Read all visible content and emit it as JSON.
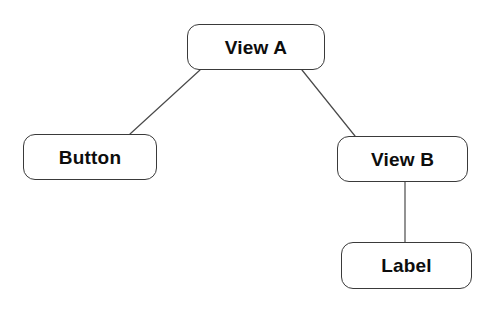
{
  "diagram": {
    "background_color": "#ffffff",
    "node_fill_color": "#ffffff",
    "node_border_color": "#3a3a3a",
    "node_text_color": "#0d0d0d",
    "edge_color": "#4a4a4a",
    "nodes": [
      {
        "id": "view-a",
        "label": "View A",
        "x": 187,
        "y": 24,
        "width": 138,
        "height": 46
      },
      {
        "id": "button",
        "label": "Button",
        "x": 23,
        "y": 134,
        "width": 134,
        "height": 46
      },
      {
        "id": "view-b",
        "label": "View B",
        "x": 337,
        "y": 136,
        "width": 131,
        "height": 46
      },
      {
        "id": "label",
        "label": "Label",
        "x": 341,
        "y": 242,
        "width": 131,
        "height": 47
      }
    ],
    "edges": [
      {
        "id": "edge-view-a-button",
        "from": "view-a",
        "to": "button",
        "x1": 200,
        "y1": 70,
        "x2": 130,
        "y2": 134
      },
      {
        "id": "edge-view-a-view-b",
        "from": "view-a",
        "to": "view-b",
        "x1": 302,
        "y1": 70,
        "x2": 355,
        "y2": 136
      },
      {
        "id": "edge-view-b-label",
        "from": "view-b",
        "to": "label",
        "x1": 405,
        "y1": 182,
        "x2": 405,
        "y2": 242
      }
    ]
  }
}
